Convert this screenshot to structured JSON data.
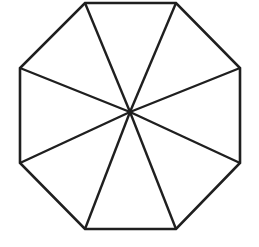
{
  "figure": {
    "name": "regular-octagon-with-radial-spokes",
    "shape_type": "polygon",
    "sides": 8,
    "background_color": "#ffffff",
    "stroke_color": "#1f1f1f",
    "stroke_width": 2.6,
    "fill_color": "#ffffff",
    "center_point": {
      "x": 130,
      "y": 112
    },
    "vertices": [
      {
        "index": 0,
        "label": "top-left",
        "x": 85,
        "y": 3
      },
      {
        "index": 1,
        "label": "top-right",
        "x": 176,
        "y": 3
      },
      {
        "index": 2,
        "label": "right-upper",
        "x": 240,
        "y": 68
      },
      {
        "index": 3,
        "label": "right-lower",
        "x": 240,
        "y": 163
      },
      {
        "index": 4,
        "label": "bottom-right",
        "x": 176,
        "y": 229
      },
      {
        "index": 5,
        "label": "bottom-left",
        "x": 85,
        "y": 229
      },
      {
        "index": 6,
        "label": "left-lower",
        "x": 20,
        "y": 163
      },
      {
        "index": 7,
        "label": "left-upper",
        "x": 20,
        "y": 68
      }
    ],
    "outline_path": "M 85,3 L 176,3 L 240,68 L 240,163 L 176,229 L 85,229 L 20,163 L 20,68 Z",
    "spokes": [
      {
        "index": 0,
        "to_vertex": "top-left",
        "path": "M 130,112 L 85,3"
      },
      {
        "index": 1,
        "to_vertex": "top-right",
        "path": "M 130,112 L 176,3"
      },
      {
        "index": 2,
        "to_vertex": "right-upper",
        "path": "M 130,112 L 240,68"
      },
      {
        "index": 3,
        "to_vertex": "right-lower",
        "path": "M 130,112 L 240,163"
      },
      {
        "index": 4,
        "to_vertex": "bottom-right",
        "path": "M 130,112 L 176,229"
      },
      {
        "index": 5,
        "to_vertex": "bottom-left",
        "path": "M 130,112 L 85,229"
      },
      {
        "index": 6,
        "to_vertex": "left-lower",
        "path": "M 130,112 L 20,163"
      },
      {
        "index": 7,
        "to_vertex": "left-upper",
        "path": "M 130,112 L 20,68"
      }
    ],
    "sectors_count": 8
  }
}
